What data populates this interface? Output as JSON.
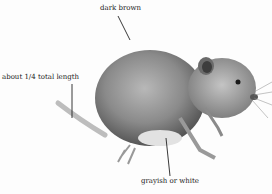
{
  "figure": {
    "labels": {
      "back": "dark brown",
      "tail": "about 1/4 total length",
      "belly": "grayish or white"
    }
  }
}
